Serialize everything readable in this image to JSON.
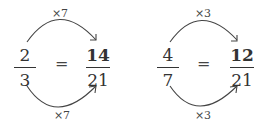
{
  "equations": [
    {
      "left": {
        "numerator": "2",
        "denominator": "3"
      },
      "equals": "=",
      "right": {
        "numerator": "14",
        "denominator": "21"
      },
      "top_label": "×7",
      "bottom_label": "×7"
    },
    {
      "left": {
        "numerator": "4",
        "denominator": "7"
      },
      "equals": "=",
      "right": {
        "numerator": "12",
        "denominator": "21"
      },
      "top_label": "×3",
      "bottom_label": "×3"
    }
  ],
  "colors": {
    "text": "#333333",
    "arrow": "#444444"
  }
}
